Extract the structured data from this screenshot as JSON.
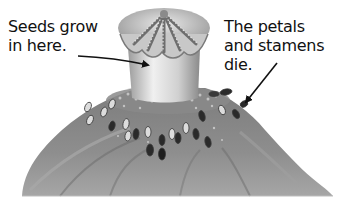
{
  "diagram": {
    "labels": [
      {
        "id": "seeds",
        "lines": [
          "Seeds grow",
          "in here."
        ],
        "points_to": "seed-pod"
      },
      {
        "id": "petals",
        "lines": [
          "The petals",
          "and stamens",
          "die."
        ],
        "points_to": "stamens"
      }
    ]
  },
  "colors": {
    "background": "#ffffff",
    "text": "#111111",
    "arrow": "#111111",
    "petal_dark": "#6e6e6e",
    "petal_mid": "#8c8c8c",
    "petal_light": "#b4b4b4",
    "pod_light": "#e6e6e6",
    "pod_shade": "#9a9a9a",
    "stamen_dark": "#2a2a2a",
    "stamen_light": "#dcdcdc"
  }
}
